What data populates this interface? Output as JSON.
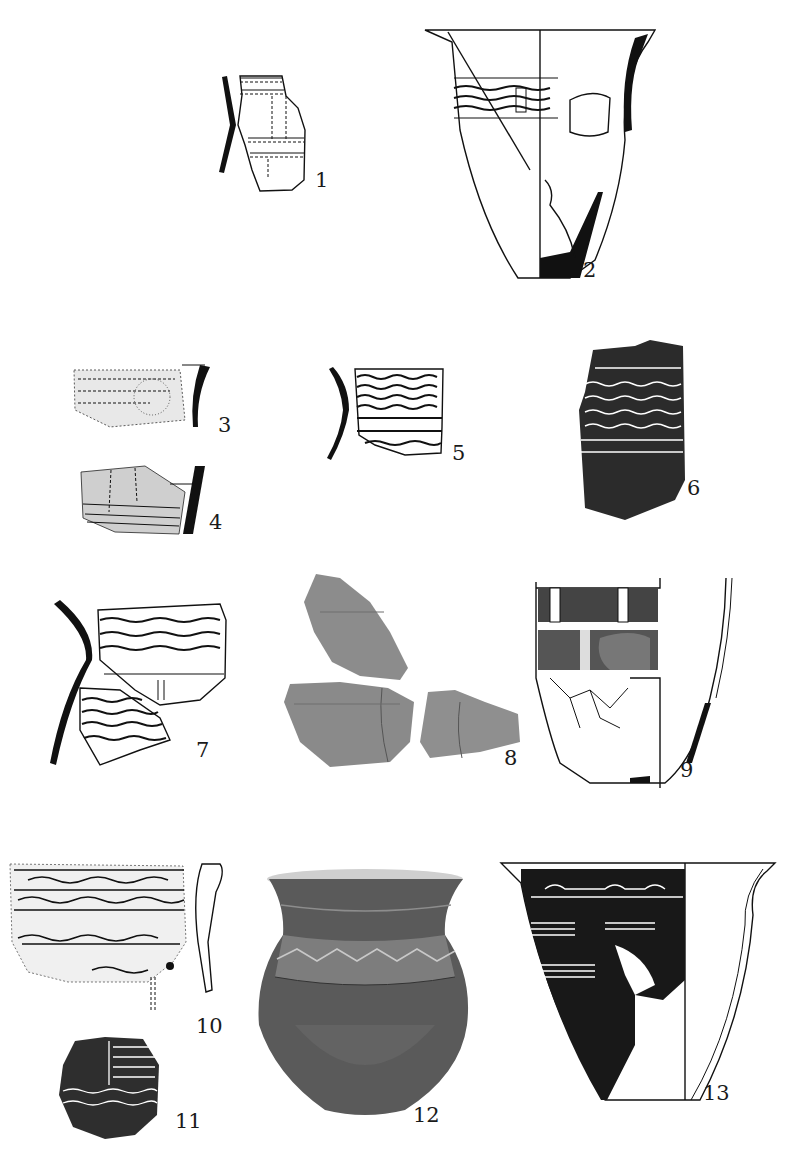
{
  "plate": {
    "description": "Plate of pottery sherd and vessel drawings/photographs, numbered figures",
    "figures": [
      {
        "id": "1",
        "label": "1",
        "type": "line-drawing",
        "subject": "rim sherd with incised vertical and horizontal bands, profile at left"
      },
      {
        "id": "2",
        "label": "2",
        "type": "line-drawing",
        "subject": "reconstructed flared-rim jar, half-section with decorated band"
      },
      {
        "id": "3",
        "label": "3",
        "type": "rubbing",
        "subject": "stippled sherd with profile"
      },
      {
        "id": "4",
        "label": "4",
        "type": "rubbing",
        "subject": "sherd with incised lines and profile"
      },
      {
        "id": "5",
        "label": "5",
        "type": "line-drawing",
        "subject": "neck sherd with wavy and horizontal bands, profile"
      },
      {
        "id": "6",
        "label": "6",
        "type": "rubbing",
        "subject": "sherd with wavy-line zones"
      },
      {
        "id": "7",
        "label": "7",
        "type": "line-drawing",
        "subject": "two sherds with wavy bands, curved profile"
      },
      {
        "id": "8",
        "label": "8",
        "type": "photograph",
        "subject": "three joined sherd fragments"
      },
      {
        "id": "9",
        "label": "9",
        "type": "line-drawing",
        "subject": "reconstructed deep bowl with hatched zones, half-section"
      },
      {
        "id": "10",
        "label": "10",
        "type": "rubbing",
        "subject": "rim sherd with wavy bands and profile"
      },
      {
        "id": "11",
        "label": "11",
        "type": "rubbing",
        "subject": "small sherd with vertical divider"
      },
      {
        "id": "12",
        "label": "12",
        "type": "photograph",
        "subject": "complete jar with zigzag band on shoulder"
      },
      {
        "id": "13",
        "label": "13",
        "type": "rubbing",
        "subject": "flared-rim bowl with dense decoration, half-section"
      }
    ]
  },
  "colors": {
    "ink": "#111111",
    "photo": "#8a8a8a",
    "paper": "#ffffff"
  }
}
